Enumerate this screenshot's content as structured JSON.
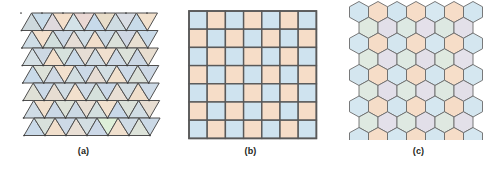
{
  "figure": {
    "background": "#ffffff",
    "stroke_color": "#4a4a4a",
    "panel_count": 3
  },
  "panels": [
    {
      "id": "panel-a",
      "label": "(a)",
      "tiling": "triangular",
      "description": "regular triangle tiling",
      "rows": 7,
      "cols": 6,
      "origin_x": 21,
      "origin_y": 13,
      "cell_width": 21,
      "cell_height": 17.5,
      "stroke_color": "#4f4f4f",
      "stroke_width": 1.0,
      "shear": 3.0,
      "palette": [
        "#c6dcea",
        "#f6dcc4",
        "#d6e3d2",
        "#cfd3e2",
        "#e3dce8",
        "#d9e6e8",
        "#f0e3cd",
        "#cbdae6"
      ],
      "colors": [
        [
          "#cdd8dc",
          "#c9dce9",
          "#dfd9dd",
          "#f4dfca",
          "#d3e2e8",
          "#ead8d4",
          "#c7daea",
          "#e8ddc9",
          "#cfdce2",
          "#d9dde4",
          "#c8dbe9",
          "#f2e1cd"
        ],
        [
          "#cfdde6",
          "#f3e0cd",
          "#d2dfdd",
          "#cdd9e5",
          "#e6ddd6",
          "#d1dee6",
          "#f1decb",
          "#cbd9e4",
          "#dbe1da",
          "#cfd6e3",
          "#e9e0d2",
          "#c9dae8"
        ],
        [
          "#d4dfe4",
          "#cdd8e3",
          "#f2dfcb",
          "#d6e2dd",
          "#cadae8",
          "#e7ded5",
          "#d0dce4",
          "#f0e0cf",
          "#cedae6",
          "#dce2da",
          "#cbd7e4",
          "#e8ded0"
        ],
        [
          "#c9dae9",
          "#dde2d9",
          "#cfd9e4",
          "#f3e1ce",
          "#d2dee1",
          "#ccd9e7",
          "#e6dcd3",
          "#d3dfe3",
          "#f1e0cc",
          "#cddae7",
          "#dae0d9",
          "#cdd8e5"
        ],
        [
          "#dfe0d6",
          "#cbd9e7",
          "#e7ddd2",
          "#d1dce3",
          "#f2e0cd",
          "#cfdbe6",
          "#d5e1dc",
          "#cad8e8",
          "#e9dfd4",
          "#d2dde2",
          "#f0dfcb",
          "#cedbe7"
        ],
        [
          "#d0dce5",
          "#f1e0cd",
          "#cbd8e6",
          "#dde2d8",
          "#ccd9e4",
          "#e8ded3",
          "#d4e0df",
          "#f2e1ce",
          "#c9d8e8",
          "#dbe1d9",
          "#d1dde4",
          "#e7ddd1"
        ],
        [
          "#cadae9",
          "#d8e1dc",
          "#f1dfcc",
          "#cdd9e6",
          "#e9dfd5",
          "#d3dee2",
          "#ccd8e7",
          "#def0d9",
          "#f0e0ce",
          "#cfdbe5",
          "#dde3da",
          "#cbd9e6"
        ]
      ]
    },
    {
      "id": "panel-b",
      "label": "(b)",
      "tiling": "square",
      "description": "regular square tiling, checkerboard coloring",
      "rows": 7,
      "cols": 7,
      "origin_x": 22,
      "origin_y": 11,
      "cell_size": 18.2,
      "stroke_color": "#595959",
      "stroke_width": 1.4,
      "color_light": "#cfe3ef",
      "color_peach": "#f6ddc8",
      "colors": [
        [
          "#cfe3ef",
          "#f6ddc8",
          "#cfe3ef",
          "#f6ddc8",
          "#cfe3ef",
          "#f6ddc8",
          "#cfe3ef"
        ],
        [
          "#f6ddc8",
          "#cfe3ef",
          "#f6ddc8",
          "#cfe3ef",
          "#f6ddc8",
          "#cfe3ef",
          "#f6ddc8"
        ],
        [
          "#cfe3ef",
          "#f6ddc8",
          "#cfe3ef",
          "#f6ddc8",
          "#cfe3ef",
          "#f6ddc8",
          "#cfe3ef"
        ],
        [
          "#f6ddc8",
          "#cfe3ef",
          "#f6ddc8",
          "#cfe3ef",
          "#f6ddc8",
          "#cfe3ef",
          "#f6ddc8"
        ],
        [
          "#cfe3ef",
          "#f6ddc8",
          "#cfe3ef",
          "#f6ddc8",
          "#cfe3ef",
          "#f6ddc8",
          "#cfe3ef"
        ],
        [
          "#f6ddc8",
          "#cfe3ef",
          "#f6ddc8",
          "#cfe3ef",
          "#f6ddc8",
          "#cfe3ef",
          "#f6ddc8"
        ],
        [
          "#cfe3ef",
          "#f6ddc8",
          "#cfe3ef",
          "#f6ddc8",
          "#cfe3ef",
          "#f6ddc8",
          "#cfe3ef"
        ]
      ]
    },
    {
      "id": "panel-c",
      "label": "(c)",
      "tiling": "hexagonal",
      "description": "regular hexagon tiling, honeycomb",
      "rows": 9,
      "cols": 7,
      "origin_x": 24,
      "origin_y": 12,
      "hex_width": 19.0,
      "hex_height": 21.0,
      "stroke_color": "#6b6b6b",
      "stroke_width": 0.9,
      "colors": [
        [
          "#d3e6f0",
          "#f6ddc8",
          "#d3e6f0",
          "#f6ddc8",
          "#d7e8f1",
          "#f6ddc8",
          "#d3e6f0"
        ],
        [
          "#dfe9e0",
          "#e2dfe9",
          "#dde9e3",
          "#e4e0ea",
          "#dde8e2",
          "#e3e0e9",
          "#dee9e1"
        ],
        [
          "#d5e7f0",
          "#f5dcc7",
          "#d4e6ef",
          "#f5ddc9",
          "#d6e7f0",
          "#f6ddc8",
          "#d4e6ef"
        ],
        [
          "#e0eae1",
          "#e3e0ea",
          "#dee9e2",
          "#e2dfe8",
          "#dfe9e0",
          "#e4e1ea",
          "#dee8e2"
        ],
        [
          "#d4e6ef",
          "#f6ddc8",
          "#d5e7f0",
          "#f5dcc7",
          "#d4e6ef",
          "#f6dec9",
          "#d5e7f0"
        ],
        [
          "#dfe9e1",
          "#e2dfe9",
          "#dfe9e2",
          "#e3e0e9",
          "#dee8e1",
          "#e2dfe8",
          "#dfe9e1"
        ],
        [
          "#d5e7f0",
          "#f5ddc8",
          "#d4e6ef",
          "#f6ddc8",
          "#d5e7f0",
          "#f5dcc7",
          "#d4e6ef"
        ],
        [
          "#dee9e1",
          "#e3e0ea",
          "#dfe9e2",
          "#e2dfe9",
          "#dfe8e1",
          "#e3e0e9",
          "#dee9e2"
        ],
        [
          "#d4e6ef",
          "#f6ddc8",
          "#d5e7f0",
          "#f5ddc8",
          "#d4e6ef",
          "#f6ddc8",
          "#d5e7f0"
        ]
      ]
    }
  ]
}
